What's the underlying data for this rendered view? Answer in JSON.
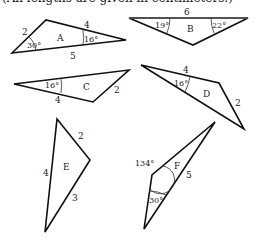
{
  "caption": "(All lengths are given in centimeters.)",
  "triangles": {
    "A": {
      "name": "A",
      "sides": [
        "2",
        "4",
        "5"
      ],
      "angles": [
        "30°",
        "16°"
      ]
    },
    "B": {
      "name": "B",
      "sides": [
        "6"
      ],
      "angles": [
        "19°",
        "22°"
      ]
    },
    "C": {
      "name": "C",
      "sides": [
        "4",
        "2"
      ],
      "angles": [
        "16°"
      ]
    },
    "D": {
      "name": "D",
      "sides": [
        "4",
        "2"
      ],
      "angles": [
        "16°"
      ]
    },
    "E": {
      "name": "E",
      "sides": [
        "2",
        "4",
        "3"
      ],
      "angles": []
    },
    "F": {
      "name": "F",
      "sides": [
        "5"
      ],
      "angles": [
        "134°",
        "30°"
      ]
    }
  }
}
